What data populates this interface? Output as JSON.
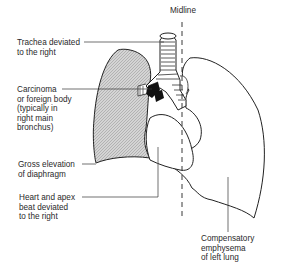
{
  "diagram": {
    "midline_label": "Midline",
    "labels": [
      {
        "id": "trachea",
        "text": "Trachea deviated\nto the right"
      },
      {
        "id": "carcinoma",
        "text": "Carcinoma\nor foreign body\n(typically in\nright main\nbronchus)"
      },
      {
        "id": "diaphragm",
        "text": "Gross elevation\nof diaphragm"
      },
      {
        "id": "heart",
        "text": "Heart and apex\nbeat deviated\nto the right"
      },
      {
        "id": "emphysema",
        "text": "Compensatory\nemphysema\nof left lung"
      }
    ],
    "colors": {
      "line": "#222222",
      "shading": "#c8c8c8"
    }
  }
}
